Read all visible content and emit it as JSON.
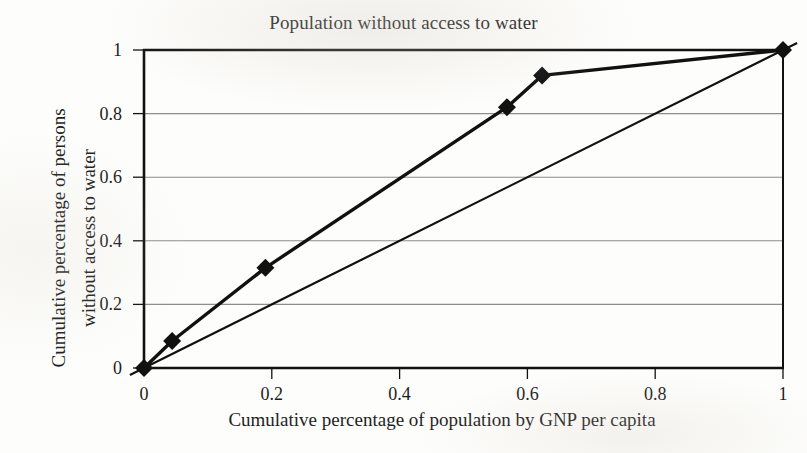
{
  "chart_data": {
    "type": "line",
    "title": "Population without access to water",
    "xlabel": "Cumulative percentage of population by GNP per capita",
    "ylabel_line1": "Cumulative percentage of persons",
    "ylabel_line2": "without access to water",
    "xlim": [
      0,
      1
    ],
    "ylim": [
      0,
      1
    ],
    "xticks": [
      "0",
      "0.2",
      "0.4",
      "0.6",
      "0.8",
      "1"
    ],
    "xtick_values": [
      0,
      0.2,
      0.4,
      0.6,
      0.8,
      1
    ],
    "yticks": [
      "0",
      "0.2",
      "0.4",
      "0.6",
      "0.8",
      "1"
    ],
    "ytick_values": [
      0,
      0.2,
      0.4,
      0.6,
      0.8,
      1
    ],
    "grid": "horizontal",
    "legend": "none",
    "series": [
      {
        "name": "Lorenz curve",
        "marker": "filled-diamond",
        "color": "#111111",
        "x": [
          0,
          0.044,
          0.19,
          0.568,
          0.623,
          1
        ],
        "y": [
          0,
          0.085,
          0.315,
          0.82,
          0.92,
          1
        ]
      },
      {
        "name": "Line of equality",
        "marker": "none",
        "color": "#111111",
        "x": [
          0,
          1
        ],
        "y": [
          0,
          1
        ]
      }
    ]
  },
  "plot": {
    "area": {
      "left": 144,
      "top": 50,
      "right": 783,
      "bottom": 368
    },
    "colors": {
      "curve": "#111111",
      "equality_line": "#1a1a1a",
      "gridline": "#8d8d8d",
      "axis": "#111111",
      "background": "#fdfdfb"
    }
  }
}
